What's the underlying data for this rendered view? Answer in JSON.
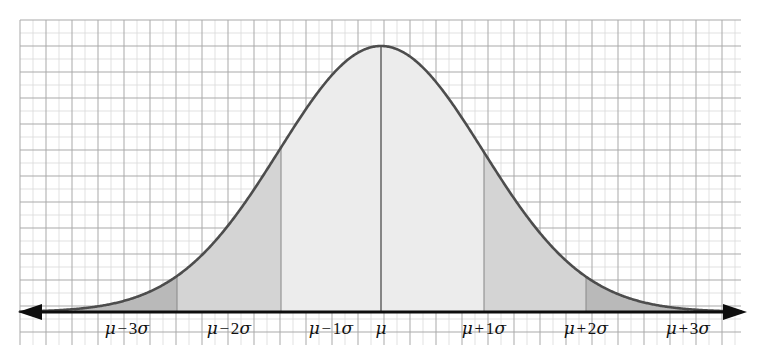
{
  "figure": {
    "background_color": "#ffffff",
    "curve_color": "#4d4d4d",
    "axis_color": "#0d0d0d",
    "grid_color_major": "#a9a9a9",
    "grid_color_minor": "#d9d9d9",
    "grid": {
      "left": 20,
      "top": 20,
      "right": 741,
      "bottom": 345,
      "cell": 26,
      "visible": true
    }
  },
  "axis": {
    "baseline_y": 312,
    "left_arrow": "arrow-left",
    "right_arrow": "arrow-right",
    "labels": [
      {
        "id": "mu-minus-3sigma",
        "mu": "μ",
        "op": "−",
        "num": "3",
        "sigma": "σ",
        "x": 127
      },
      {
        "id": "mu-minus-2sigma",
        "mu": "μ",
        "op": "−",
        "num": "2",
        "sigma": "σ",
        "x": 229
      },
      {
        "id": "mu-minus-1sigma",
        "mu": "μ",
        "op": "−",
        "num": "1",
        "sigma": "σ",
        "x": 331
      },
      {
        "id": "mu",
        "mu": "μ",
        "op": "",
        "num": "",
        "sigma": "",
        "x": 381
      },
      {
        "id": "mu-plus-1sigma",
        "mu": "μ",
        "op": "+",
        "num": "1",
        "sigma": "σ",
        "x": 484
      },
      {
        "id": "mu-plus-2sigma",
        "mu": "μ",
        "op": "+",
        "num": "2",
        "sigma": "σ",
        "x": 586
      },
      {
        "id": "mu-plus-3sigma",
        "mu": "μ",
        "op": "+",
        "num": "3",
        "sigma": "σ",
        "x": 688
      }
    ],
    "label_y": 328
  },
  "chart_data": {
    "type": "area",
    "xlabel": "",
    "ylabel": "",
    "distribution": "normal",
    "mean_px": 381,
    "sigma_px": 102,
    "peak_y_px": 46,
    "baseline_y_px": 312,
    "peak_height_px": 266,
    "xlim_px": [
      20,
      741
    ],
    "grid": true,
    "legend": false,
    "tick_labels": [
      "μ − 3σ",
      "μ − 2σ",
      "μ − 1σ",
      "μ",
      "μ + 1σ",
      "μ + 2σ",
      "μ + 3σ"
    ],
    "tick_x_px": [
      127,
      229,
      331,
      381,
      484,
      586,
      688
    ],
    "boundaries_px": [
      75,
      177,
      281,
      381,
      484,
      586,
      688
    ],
    "bands": [
      {
        "name": "minus-3-to-minus-2-sigma",
        "from_px": 75,
        "to_px": 177,
        "fill": "#b9b9b9",
        "area_share": 0.0215
      },
      {
        "name": "minus-2-to-minus-1-sigma",
        "from_px": 177,
        "to_px": 281,
        "fill": "#d4d4d4",
        "area_share": 0.1359
      },
      {
        "name": "minus-1-to-0-sigma",
        "from_px": 281,
        "to_px": 381,
        "fill": "#ececec",
        "area_share": 0.3413
      },
      {
        "name": "0-to-plus-1-sigma",
        "from_px": 381,
        "to_px": 484,
        "fill": "#ececec",
        "area_share": 0.3413
      },
      {
        "name": "plus-1-to-plus-2-sigma",
        "from_px": 484,
        "to_px": 586,
        "fill": "#d4d4d4",
        "area_share": 0.1359
      },
      {
        "name": "plus-2-to-plus-3-sigma",
        "from_px": 586,
        "to_px": 688,
        "fill": "#b9b9b9",
        "area_share": 0.0215
      }
    ],
    "curve_points_normalized": [
      {
        "z": -3.5,
        "y": 0.0022
      },
      {
        "z": -3.0,
        "y": 0.0111
      },
      {
        "z": -2.5,
        "y": 0.0439
      },
      {
        "z": -2.0,
        "y": 0.1353
      },
      {
        "z": -1.5,
        "y": 0.3247
      },
      {
        "z": -1.0,
        "y": 0.6065
      },
      {
        "z": -0.5,
        "y": 0.8825
      },
      {
        "z": 0.0,
        "y": 1.0
      },
      {
        "z": 0.5,
        "y": 0.8825
      },
      {
        "z": 1.0,
        "y": 0.6065
      },
      {
        "z": 1.5,
        "y": 0.3247
      },
      {
        "z": 2.0,
        "y": 0.1353
      },
      {
        "z": 2.5,
        "y": 0.0439
      },
      {
        "z": 3.0,
        "y": 0.0111
      },
      {
        "z": 3.5,
        "y": 0.0022
      }
    ]
  }
}
